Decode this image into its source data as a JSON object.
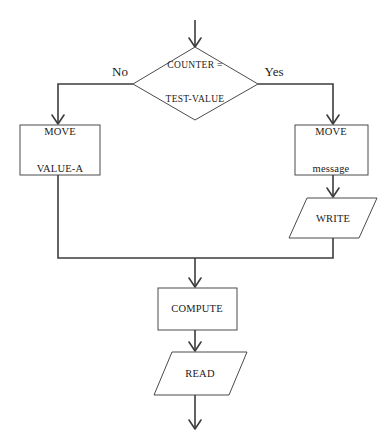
{
  "diagram": {
    "type": "flowchart",
    "title": "",
    "nodes": {
      "decision": {
        "shape": "diamond",
        "line1": "COUNTER =",
        "line2": "TEST-VALUE"
      },
      "move_value_a": {
        "shape": "process",
        "line1": "MOVE",
        "line2": "VALUE-A"
      },
      "move_message": {
        "shape": "process",
        "line1": "MOVE",
        "line2": "message"
      },
      "write": {
        "shape": "input-output",
        "label": "WRITE"
      },
      "compute": {
        "shape": "process",
        "label": "COMPUTE"
      },
      "read": {
        "shape": "input-output",
        "label": "READ"
      }
    },
    "branch_labels": {
      "no": "No",
      "yes": "Yes"
    },
    "colors": {
      "background": "#ffffff",
      "shape_stroke": "#4a4a4a",
      "connector": "#3c3c3c",
      "text": "#1a1a1a"
    }
  }
}
